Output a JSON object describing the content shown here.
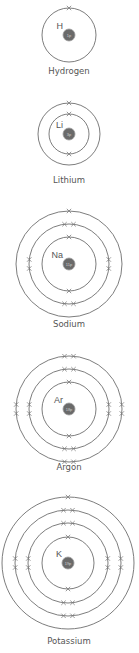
{
  "atoms": [
    {
      "name": "Hydrogen",
      "symbol": "H",
      "nucleus_label": "1p",
      "shells": [
        1
      ]
    },
    {
      "name": "Lithium",
      "symbol": "Li",
      "nucleus_label": "3p",
      "shells": [
        2,
        1
      ]
    },
    {
      "name": "Sodium",
      "symbol": "Na",
      "nucleus_label": "11p",
      "shells": [
        2,
        8,
        1
      ]
    },
    {
      "name": "Argon",
      "symbol": "Ar",
      "nucleus_label": "18p",
      "shells": [
        2,
        8,
        8
      ]
    },
    {
      "name": "Potassium",
      "symbol": "K",
      "nucleus_label": "19p",
      "shells": [
        2,
        8,
        8,
        1
      ]
    }
  ]
}
